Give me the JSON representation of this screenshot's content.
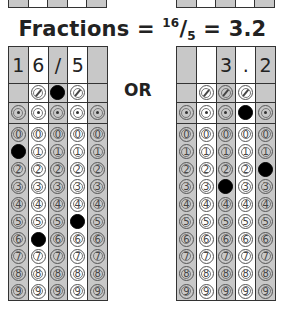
{
  "title": {
    "prefix": "Fractions = ",
    "numerator": "16",
    "slash": "/",
    "denominator": "5",
    "suffix": " = 3.2"
  },
  "separator_label": "OR",
  "column_shading": [
    "gray",
    "white",
    "gray",
    "white",
    "gray"
  ],
  "digits": [
    "0",
    "1",
    "2",
    "3",
    "4",
    "5",
    "6",
    "7",
    "8",
    "9"
  ],
  "grids": [
    {
      "name": "fraction-answer",
      "header": [
        "1",
        "6",
        "/",
        "5",
        ""
      ],
      "slash_row": [
        "none",
        "empty",
        "filled",
        "empty",
        "none"
      ],
      "decimal_row": [
        "empty",
        "empty",
        "empty",
        "empty",
        "empty"
      ],
      "filled_digits": [
        1,
        6,
        null,
        5,
        null
      ]
    },
    {
      "name": "decimal-answer",
      "header": [
        "",
        "",
        "3",
        ".",
        "2"
      ],
      "slash_row": [
        "none",
        "empty",
        "empty",
        "empty",
        "none"
      ],
      "decimal_row": [
        "empty",
        "empty",
        "empty",
        "filled",
        "empty"
      ],
      "filled_digits": [
        null,
        null,
        3,
        null,
        2
      ]
    }
  ]
}
